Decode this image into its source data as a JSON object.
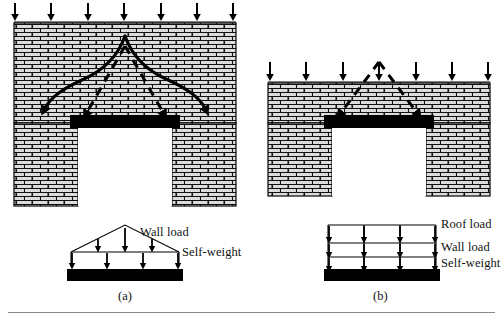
{
  "figure": {
    "panels": [
      {
        "id": "a",
        "caption": "(a)",
        "wall": {
          "hatch": "brick-running-bond",
          "top_arrow_count": 7,
          "description": "tall masonry wall with door opening and lintel",
          "arch_type": "pointed-arch",
          "spread_lines": "dashed-45-degree"
        },
        "load_diagram": {
          "type": "triangular-plus-uniform",
          "labels": [
            "Wall load",
            "Self-weight"
          ],
          "upper_arrow_count": 3,
          "lower_arrow_count": 4
        }
      },
      {
        "id": "b",
        "caption": "(b)",
        "wall": {
          "hatch": "brick-running-bond",
          "top_arrow_count": 7,
          "description": "short masonry wall with door opening and lintel",
          "arch_type": "none",
          "spread_lines": "dashed-45-degree"
        },
        "load_diagram": {
          "type": "stacked-uniform",
          "labels": [
            "Roof load",
            "Wall load",
            "Self-weight"
          ],
          "bands": 3,
          "arrows_per_band": 4
        }
      }
    ],
    "labels": {
      "wall_load": "Wall load",
      "self_weight": "Self-weight",
      "roof_load": "Roof load",
      "caption_a": "(a)",
      "caption_b": "(b)"
    },
    "colors": {
      "line": "#000000",
      "fill_beam": "#000000",
      "brick_mortar": "#1a1a1a",
      "brick_face": "#d8d8d8",
      "rule": "#8a8a8a",
      "background": "#ffffff"
    }
  }
}
